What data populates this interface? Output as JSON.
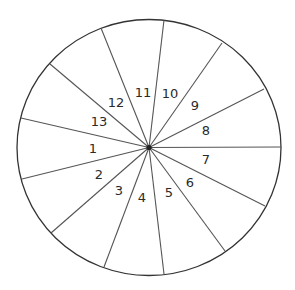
{
  "diagram": {
    "type": "spinner-wheel",
    "sector_count": 13,
    "colors": {
      "line": "#333333",
      "text": "#2a2a2a",
      "background": "#ffffff"
    },
    "sectors": [
      {
        "label": "1"
      },
      {
        "label": "2"
      },
      {
        "label": "3"
      },
      {
        "label": "4"
      },
      {
        "label": "5"
      },
      {
        "label": "6"
      },
      {
        "label": "7"
      },
      {
        "label": "8"
      },
      {
        "label": "9"
      },
      {
        "label": "10"
      },
      {
        "label": "11"
      },
      {
        "label": "12"
      },
      {
        "label": "13"
      }
    ]
  }
}
